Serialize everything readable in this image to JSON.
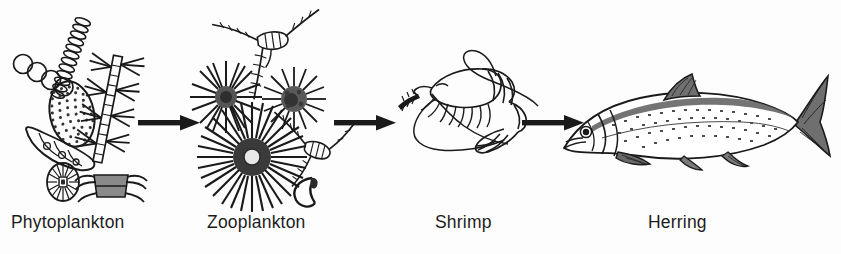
{
  "diagram": {
    "type": "linear-food-chain",
    "background_color": "#fdfdfd",
    "ink_color": "#1a1a1a",
    "label_color": "#1c1c1c",
    "stages": [
      {
        "id": "phytoplankton",
        "label": "Phytoplankton",
        "order": 1,
        "illustration": "phytoplankton-cluster",
        "organisms": [
          "circle-chain-colony",
          "helical-spiral-filament",
          "stippled-oval-diatom",
          "curved-cell-chain",
          "radial-wheel-diatom",
          "barbed-chain-diatom",
          "barrel-setae-diatom"
        ]
      },
      {
        "id": "zooplankton",
        "label": "Zooplankton",
        "order": 2,
        "illustration": "zooplankton-cluster",
        "organisms": [
          "large-radiolarian",
          "small-radiolarian-left",
          "small-radiolarian-right",
          "copepod-upper",
          "copepod-right",
          "crescent-larva"
        ]
      },
      {
        "id": "shrimp",
        "label": "Shrimp",
        "order": 3,
        "illustration": "shrimp-line-art",
        "organisms": [
          "shrimp"
        ]
      },
      {
        "id": "herring",
        "label": "Herring",
        "order": 4,
        "illustration": "herring-line-art",
        "organisms": [
          "herring"
        ]
      }
    ],
    "arrows": [
      {
        "id": "arrow-1",
        "from": "phytoplankton",
        "to": "zooplankton",
        "direction": "right"
      },
      {
        "id": "arrow-2",
        "from": "zooplankton",
        "to": "shrimp",
        "direction": "right"
      },
      {
        "id": "arrow-3",
        "from": "shrimp",
        "to": "herring",
        "direction": "right"
      }
    ]
  }
}
